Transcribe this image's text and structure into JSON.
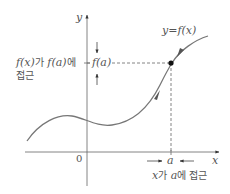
{
  "diagram": {
    "type": "limit-of-function",
    "labels": {
      "y_axis": "y",
      "x_axis": "x",
      "origin": "0",
      "curve": "y=f(x)",
      "fa": "f(a)",
      "a": "a",
      "left_note_line1_fx": "f(x)",
      "left_note_line1_ga": "가",
      "left_note_line1_fa": "f(a)",
      "left_note_line1_e": "에",
      "left_note_line2": "접근",
      "bottom_note_x": "x",
      "bottom_note_ga": "가",
      "bottom_note_a": "a",
      "bottom_note_rest": "에 접근"
    },
    "colors": {
      "stroke": "#555555",
      "curve": "#666666",
      "point": "#111111",
      "text": "#555555"
    }
  }
}
